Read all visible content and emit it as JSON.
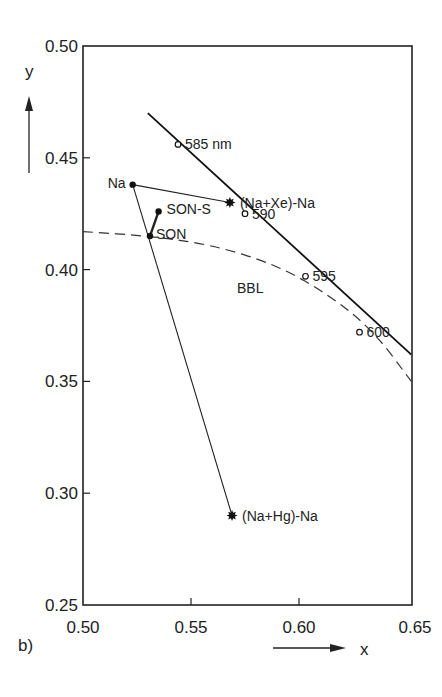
{
  "chart_data": {
    "type": "scatter",
    "title": "",
    "panel_label": "b)",
    "xlabel": "x",
    "ylabel": "y",
    "xlim": [
      0.5,
      0.65
    ],
    "ylim": [
      0.25,
      0.5
    ],
    "grid": false,
    "x_ticks": [
      "0.50",
      "0.55",
      "0.60",
      "0.65"
    ],
    "y_ticks": [
      "0.50",
      "0.45",
      "0.40",
      "0.35",
      "0.30",
      "0.25"
    ],
    "points": [
      {
        "label": "Na",
        "x": 0.523,
        "y": 0.438,
        "marker": "dot"
      },
      {
        "label": "SON-S",
        "x": 0.535,
        "y": 0.426,
        "marker": "dot"
      },
      {
        "label": "SON",
        "x": 0.531,
        "y": 0.415,
        "marker": "dot"
      },
      {
        "label": "(Na+Xe)-Na",
        "x": 0.568,
        "y": 0.43,
        "marker": "star"
      },
      {
        "label": "(Na+Hg)-Na",
        "x": 0.569,
        "y": 0.29,
        "marker": "star"
      }
    ],
    "spectrum_locus": {
      "start": {
        "x": 0.53,
        "y": 0.47
      },
      "end": {
        "x": 0.652,
        "y": 0.362
      },
      "wavelength_marks": [
        {
          "label": "585 nm",
          "x": 0.544,
          "y": 0.456
        },
        {
          "label": "590",
          "x": 0.575,
          "y": 0.425
        },
        {
          "label": "595",
          "x": 0.603,
          "y": 0.397
        },
        {
          "label": "600",
          "x": 0.628,
          "y": 0.372
        }
      ]
    },
    "bbl": {
      "label": "BBL",
      "style": "dashed",
      "points": [
        {
          "x": 0.5,
          "y": 0.417
        },
        {
          "x": 0.531,
          "y": 0.415
        },
        {
          "x": 0.56,
          "y": 0.411
        },
        {
          "x": 0.59,
          "y": 0.402
        },
        {
          "x": 0.615,
          "y": 0.388
        },
        {
          "x": 0.635,
          "y": 0.372
        },
        {
          "x": 0.652,
          "y": 0.35
        }
      ]
    },
    "connections": [
      [
        "Na",
        "(Na+Xe)-Na"
      ],
      [
        "Na",
        "(Na+Hg)-Na"
      ],
      [
        "SON",
        "SON-S"
      ]
    ]
  },
  "labels": {
    "panel": "b)",
    "x_axis": "x",
    "y_axis": "y",
    "bbl": "BBL"
  }
}
